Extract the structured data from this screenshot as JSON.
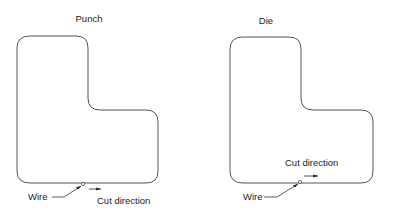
{
  "diagram": {
    "panels": [
      {
        "id": "punch",
        "title": "Punch",
        "wire_label": "Wire",
        "cut_label": "Cut direction",
        "cut_arrow_direction": "right"
      },
      {
        "id": "die",
        "title": "Die",
        "wire_label": "Wire",
        "cut_label": "Cut direction",
        "cut_arrow_direction": "right"
      }
    ],
    "colors": {
      "outline": "#555555",
      "text": "#1a1a1a",
      "background": "#ffffff"
    }
  }
}
